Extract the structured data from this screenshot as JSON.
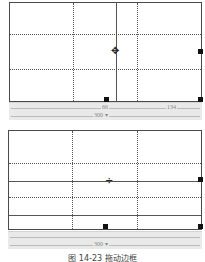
{
  "figure_top": {
    "ruler": {
      "col_label_1": "66",
      "col_label_2": "134",
      "width_label": "300 ▾"
    },
    "cursor_icon": "resize-horizontal-cursor",
    "cursor_glyph": "✥"
  },
  "figure_bottom": {
    "ruler": {
      "width_label": "300 ▾"
    },
    "cursor_icon": "resize-vertical-cursor",
    "cursor_glyph": "÷"
  },
  "tick_glyph": "ᐧ",
  "caption": "图 14-23  拖动边框",
  "colors": {
    "border": "#4a4a4a",
    "ruler_bg": "#e9e9e9",
    "handle": "#111111"
  }
}
